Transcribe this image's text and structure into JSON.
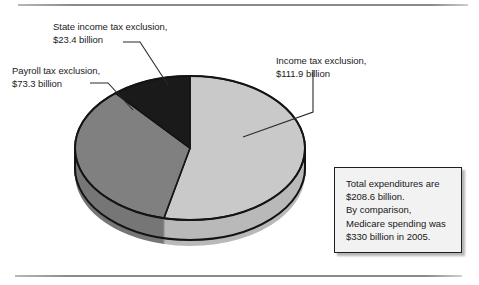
{
  "figure": {
    "background_color": "#ffffff",
    "rules": {
      "top_label": "top-divider-rule",
      "bottom_label": "bottom-divider-rule"
    }
  },
  "labels": {
    "state": "State income tax exclusion,\n$23.4 billion",
    "payroll": "Payroll tax exclusion,\n$73.3 billion",
    "income": "Income tax exclusion,\n$111.9 billion"
  },
  "note": {
    "lines": [
      "Total expenditures are",
      "$208.6 billion.",
      "By comparison,",
      "Medicare spending was",
      "$330 billion in 2005."
    ]
  },
  "chart_data": {
    "type": "pie",
    "title": "",
    "subtitle": "",
    "xlabel": "",
    "ylabel": "",
    "units": "billions of dollars",
    "total": 208.6,
    "total_label": "$208.6 billion",
    "three_d": true,
    "legend_position": "callout-labels",
    "grid": false,
    "categories": [
      "Income tax exclusion",
      "Payroll tax exclusion",
      "State income tax exclusion"
    ],
    "values": [
      111.9,
      73.3,
      23.4
    ],
    "value_labels": [
      "$111.9 billion",
      "$73.3 billion",
      "$23.4 billion"
    ],
    "percentages": [
      53.6,
      35.1,
      11.2
    ],
    "colors": [
      "#c9c9c9",
      "#808080",
      "#1a1a1a"
    ],
    "side_colors": [
      "#b0b0b0",
      "#6e6e6e",
      "#1a1a1a"
    ],
    "outline_color": "#141414",
    "highlight_color": "#ffffff",
    "annotations": [
      "Total expenditures are $208.6 billion.",
      "By comparison, Medicare spending was $330 billion in 2005."
    ]
  }
}
